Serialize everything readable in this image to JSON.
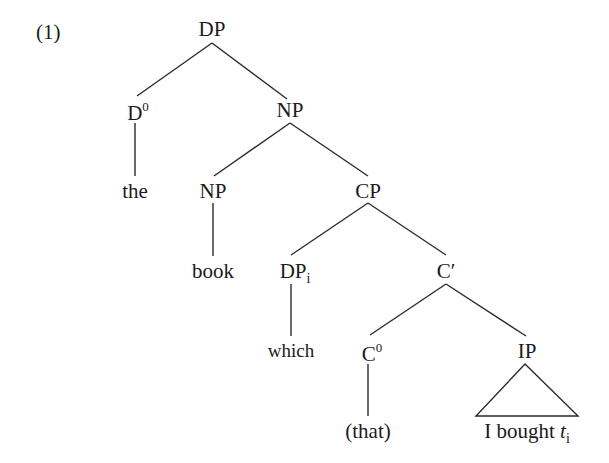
{
  "example_number": "(1)",
  "tree": {
    "nodes": {
      "dp_root": {
        "label": "DP"
      },
      "d0": {
        "label": "D",
        "sup": "0"
      },
      "np_top": {
        "label": "NP"
      },
      "the": {
        "label": "the"
      },
      "np_inner": {
        "label": "NP"
      },
      "cp": {
        "label": "CP"
      },
      "book": {
        "label": "book"
      },
      "dp_i": {
        "label": "DP",
        "sub": "i"
      },
      "c_bar": {
        "label": "C′"
      },
      "which": {
        "label": "which"
      },
      "c0": {
        "label": "C",
        "sup": "0"
      },
      "ip": {
        "label": "IP"
      },
      "that": {
        "label": "(that)"
      },
      "ip_content": {
        "label": "I bought ",
        "trace": "t",
        "trace_sub": "i"
      }
    },
    "edges": [
      [
        "dp_root",
        "d0"
      ],
      [
        "dp_root",
        "np_top"
      ],
      [
        "d0",
        "the"
      ],
      [
        "np_top",
        "np_inner"
      ],
      [
        "np_top",
        "cp"
      ],
      [
        "np_inner",
        "book"
      ],
      [
        "cp",
        "dp_i"
      ],
      [
        "cp",
        "c_bar"
      ],
      [
        "dp_i",
        "which"
      ],
      [
        "c_bar",
        "c0"
      ],
      [
        "c_bar",
        "ip"
      ],
      [
        "c0",
        "that"
      ],
      [
        "ip",
        "ip_content",
        "triangle"
      ]
    ]
  },
  "colors": {
    "line": "#2a2a2a",
    "text": "#1a1a1a",
    "background": "#ffffff"
  }
}
